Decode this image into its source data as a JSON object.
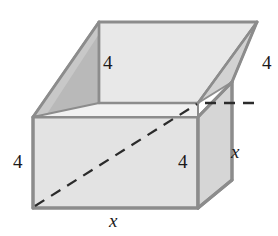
{
  "figure": {
    "shape": "open rectangular box",
    "background_color": "#ffffff",
    "colors": {
      "front_face": "#e3e3e3",
      "right_face": "#d5d5d5",
      "left_inner_wall": "#b9b9b9",
      "back_inner_wall": "#e6e6e6",
      "top_rim": "#cfcfcf",
      "edge_stroke": "#8c8c8c",
      "dashed_stroke": "#2b2b2b",
      "label_text": "#1a1a1a"
    },
    "labels": [
      {
        "id": "back-height",
        "text": "4",
        "style": "upright",
        "x": 103,
        "y": 53,
        "note": "height of back inner wall"
      },
      {
        "id": "right-height",
        "text": "4",
        "style": "upright",
        "x": 262,
        "y": 53,
        "note": "height of right rear edge"
      },
      {
        "id": "left-height",
        "text": "4",
        "style": "upright",
        "x": 13,
        "y": 152,
        "note": "height of front left edge"
      },
      {
        "id": "front-height",
        "text": "4",
        "style": "upright",
        "x": 178,
        "y": 152,
        "note": "height of front right edge"
      },
      {
        "id": "depth",
        "text": "x",
        "style": "italic",
        "x": 231,
        "y": 142,
        "note": "depth of box"
      },
      {
        "id": "width",
        "text": "x",
        "style": "italic",
        "x": 109,
        "y": 211,
        "note": "width of front bottom edge"
      }
    ],
    "geometry": {
      "front_face": "33,117 198,117 198,208 33,208",
      "right_face": "198,117 232,82 232,180 198,208",
      "top_rim_left": "33,117 99,52 198,52 198,117",
      "left_wall_inner": "99,102 99,22 33,117 99,117",
      "back_wall_inner": "99,22 257,22 198,102 99,102",
      "top_rim_right": "257,22 232,82 198,102 198,52",
      "dashed_diagonal": "33,208 198,103",
      "dashed_back": "198,103 257,103"
    }
  }
}
